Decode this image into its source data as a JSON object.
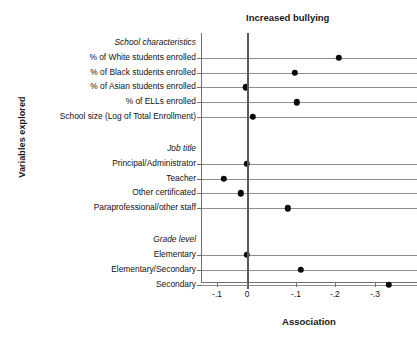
{
  "chart_data": {
    "type": "scatter",
    "title": "Increased bullying",
    "xlabel": "Association",
    "ylabel": "Variables explored",
    "grid": true,
    "legend": null,
    "xtick_labels": [
      "-.1",
      "0",
      "-.1",
      "-.2",
      "-.3"
    ],
    "xtick_positions_frac": [
      0.074,
      0.213,
      0.44,
      0.62,
      0.806
    ],
    "zero_position_frac": 0.213,
    "groups": [
      {
        "label": "School characteristics",
        "rows": [
          {
            "label": "% of White students enrolled",
            "value": "-.20",
            "x_frac": 0.639
          },
          {
            "label": "% of Black students enrolled",
            "value": "-.10",
            "x_frac": 0.435
          },
          {
            "label": "% of Asian students enrolled",
            "value": "0",
            "x_frac": 0.208
          },
          {
            "label": "% of ELLs enrolled",
            "value": "-.10",
            "x_frac": 0.444
          },
          {
            "label": "School size (Log of Total Enrollment)",
            "value": ".01",
            "x_frac": 0.241
          }
        ]
      },
      {
        "label": "Job title",
        "rows": [
          {
            "label": "Principal/Administrator",
            "value": "0",
            "x_frac": 0.213
          },
          {
            "label": "Teacher",
            "value": "-.06",
            "x_frac": 0.106
          },
          {
            "label": "Other certificated",
            "value": "-.01",
            "x_frac": 0.185
          },
          {
            "label": "Paraprofessional/other staff",
            "value": "-.08",
            "x_frac": 0.403
          }
        ]
      },
      {
        "label": "Grade level",
        "rows": [
          {
            "label": "Elementary",
            "value": "0",
            "x_frac": 0.213
          },
          {
            "label": "Elementary/Secondary",
            "value": "-.11",
            "x_frac": 0.463
          },
          {
            "label": "Secondary",
            "value": "-.33",
            "x_frac": 0.87
          }
        ]
      }
    ]
  }
}
